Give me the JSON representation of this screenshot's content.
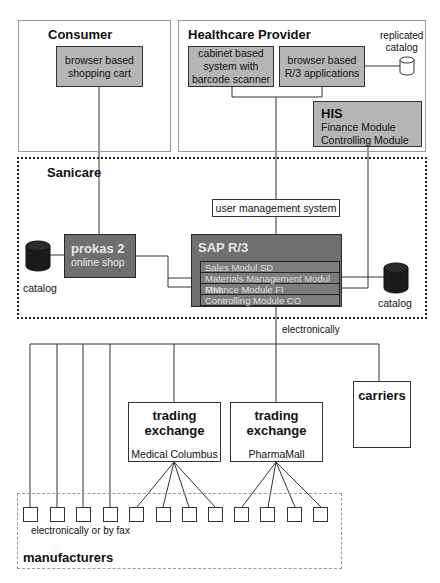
{
  "regions": {
    "consumer": {
      "title": "Consumer"
    },
    "healthcare_provider": {
      "title": "Healthcare Provider"
    },
    "sanicare": {
      "title": "Sanicare"
    },
    "manufacturers": {
      "title": "manufacturers"
    }
  },
  "consumer": {
    "shopping_cart": {
      "line1": "browser based",
      "line2": "shopping cart"
    }
  },
  "healthcare_provider": {
    "cabinet_system": {
      "line1": "cabinet based",
      "line2": "system with",
      "line3": "barcode scanner"
    },
    "r3_applications": {
      "line1": "browser based",
      "line2": "R/3 applications"
    },
    "replicated_catalog": {
      "line1": "replicated",
      "line2": "catalog",
      "icon": "database-icon"
    },
    "his": {
      "title": "HIS",
      "line1": "Finance Module",
      "line2": "Controlling Module"
    }
  },
  "sanicare": {
    "user_management": {
      "label": "user management system"
    },
    "prokas": {
      "title": "prokas 2",
      "subtitle": "online shop"
    },
    "left_catalog": {
      "label": "catalog",
      "icon": "database-icon"
    },
    "right_catalog": {
      "label": "catalog",
      "icon": "database-icon"
    },
    "sap": {
      "title": "SAP R/3",
      "modules": [
        "Sales Modul SD",
        "Materials Management Modul MM",
        "Finance Module FI",
        "Controlling Module CO"
      ]
    }
  },
  "connections": {
    "sap_to_outside": "electronically",
    "manufacturers_direct": "electronically or by fax"
  },
  "external": {
    "carriers": {
      "label": "carriers"
    },
    "exchange_left": {
      "title_line1": "trading",
      "title_line2": "exchange",
      "name": "Medical Columbus"
    },
    "exchange_right": {
      "title_line1": "trading",
      "title_line2": "exchange",
      "name": "PharmaMall"
    }
  },
  "manufacturers": {
    "count": 12
  },
  "colors": {
    "grey_box": "#b5b5b5",
    "dark_box": "#6f6f6f",
    "line": "#333333"
  }
}
